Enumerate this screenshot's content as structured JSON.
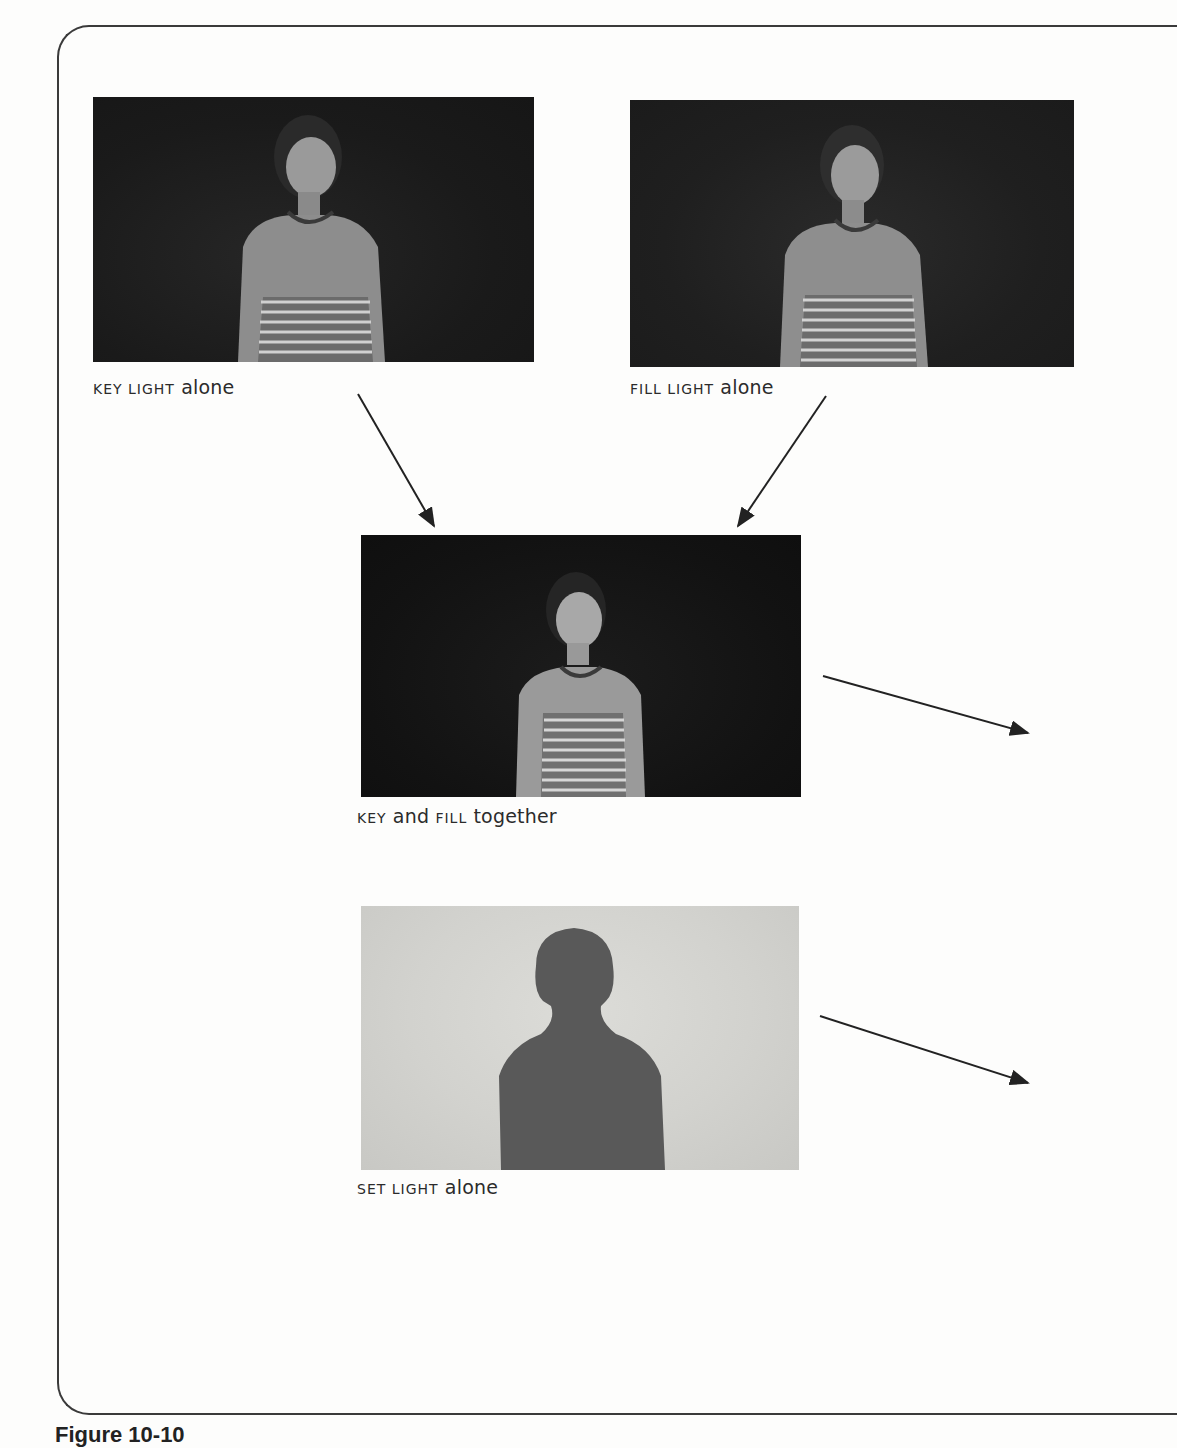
{
  "figure": {
    "label": "Figure 10-10",
    "panels": [
      {
        "id": "key",
        "caption_caps": "KEY LIGHT",
        "caption_rest": " alone",
        "description": "Woman in striped tank top lit by key light only, dark background"
      },
      {
        "id": "fill",
        "caption_caps": "FILL LIGHT",
        "caption_rest": " alone",
        "description": "Woman in striped tank top lit by fill light only, dark background"
      },
      {
        "id": "key-fill",
        "caption_caps1": "KEY",
        "caption_mid": " and ",
        "caption_caps2": "FILL",
        "caption_rest": " together",
        "description": "Woman lit by key and fill together, dark background"
      },
      {
        "id": "set",
        "caption_caps": "SET LIGHT",
        "caption_rest": " alone",
        "description": "Dark silhouette of woman against lit background"
      }
    ],
    "arrows": [
      {
        "from": "key",
        "to": "key-fill"
      },
      {
        "from": "fill",
        "to": "key-fill"
      },
      {
        "from": "key-fill",
        "to": "offscreen-right"
      },
      {
        "from": "set",
        "to": "offscreen-right"
      }
    ],
    "colors": {
      "photo_dark": "#1a1a1a",
      "photo_light": "#d2d2ce",
      "silhouette": "#555555",
      "line": "#2a2a2a"
    }
  }
}
